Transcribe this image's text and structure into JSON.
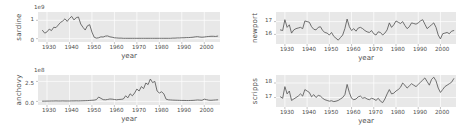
{
  "figure": {
    "width": 463,
    "height": 135,
    "background": "#ffffff",
    "panel_background": "#e8e8e8",
    "line_color": "#595959",
    "grid_color": "#ffffff"
  },
  "chart_data": [
    {
      "type": "line",
      "name": "sardine",
      "ylabel": "sardine",
      "xlabel": "year",
      "exponent": "1e9",
      "yticks": [
        "0",
        "1"
      ],
      "ytick_values": [
        0,
        1
      ],
      "ylim": [
        -0.18,
        1.45
      ],
      "xlim": [
        1926,
        2007
      ],
      "xticks": [
        "1930",
        "1940",
        "1950",
        "1960",
        "1970",
        "1980",
        "1990",
        "2000"
      ],
      "xtick_values": [
        1930,
        1940,
        1950,
        1960,
        1970,
        1980,
        1990,
        2000
      ],
      "grid": true,
      "x": [
        1928,
        1929,
        1930,
        1931,
        1932,
        1933,
        1934,
        1935,
        1936,
        1937,
        1938,
        1939,
        1940,
        1941,
        1942,
        1943,
        1944,
        1945,
        1946,
        1947,
        1948,
        1949,
        1950,
        1951,
        1952,
        1953,
        1954,
        1955,
        1956,
        1957,
        1958,
        1959,
        1960,
        1961,
        1962,
        1963,
        1964,
        1965,
        1966,
        1967,
        1968,
        1969,
        1970,
        1971,
        1972,
        1973,
        1974,
        1975,
        1976,
        1977,
        1978,
        1979,
        1980,
        1981,
        1982,
        1983,
        1984,
        1985,
        1986,
        1987,
        1988,
        1989,
        1990,
        1991,
        1992,
        1993,
        1994,
        1995,
        1996,
        1997,
        1998,
        1999,
        2000,
        2001,
        2002,
        2003,
        2004,
        2005,
        2006
      ],
      "y": [
        0.45,
        0.3,
        0.37,
        0.52,
        0.44,
        0.62,
        0.6,
        0.74,
        0.88,
        0.96,
        1.08,
        0.94,
        1.1,
        1.21,
        1.02,
        1.14,
        1.18,
        0.8,
        0.62,
        0.47,
        0.7,
        0.76,
        0.36,
        0.08,
        0.03,
        0.05,
        0.1,
        0.09,
        0.14,
        0.15,
        0.1,
        0.08,
        0.05,
        0.04,
        0.03,
        0.03,
        0.02,
        0.02,
        0.02,
        0.02,
        0.02,
        0.02,
        0.02,
        0.02,
        0.02,
        0.02,
        0.02,
        0.02,
        0.02,
        0.02,
        0.02,
        0.02,
        0.02,
        0.02,
        0.02,
        0.02,
        0.02,
        0.02,
        0.03,
        0.03,
        0.04,
        0.04,
        0.05,
        0.05,
        0.06,
        0.06,
        0.07,
        0.08,
        0.1,
        0.11,
        0.09,
        0.08,
        0.09,
        0.11,
        0.12,
        0.13,
        0.13,
        0.12,
        0.14
      ]
    },
    {
      "type": "line",
      "name": "anchovy",
      "ylabel": "anchovy",
      "xlabel": "year",
      "exponent": "1e8",
      "yticks": [
        "0.0",
        "2.5"
      ],
      "ytick_values": [
        0.0,
        2.5
      ],
      "ylim": [
        -0.45,
        3.3
      ],
      "xlim": [
        1926,
        2007
      ],
      "xticks": [
        "1930",
        "1940",
        "1950",
        "1960",
        "1970",
        "1980",
        "1990",
        "2000"
      ],
      "xtick_values": [
        1930,
        1940,
        1950,
        1960,
        1970,
        1980,
        1990,
        2000
      ],
      "grid": true,
      "x": [
        1928,
        1929,
        1930,
        1931,
        1932,
        1933,
        1934,
        1935,
        1936,
        1937,
        1938,
        1939,
        1940,
        1941,
        1942,
        1943,
        1944,
        1945,
        1946,
        1947,
        1948,
        1949,
        1950,
        1951,
        1952,
        1953,
        1954,
        1955,
        1956,
        1957,
        1958,
        1959,
        1960,
        1961,
        1962,
        1963,
        1964,
        1965,
        1966,
        1967,
        1968,
        1969,
        1970,
        1971,
        1972,
        1973,
        1974,
        1975,
        1976,
        1977,
        1978,
        1979,
        1980,
        1981,
        1982,
        1983,
        1984,
        1985,
        1986,
        1987,
        1988,
        1989,
        1990,
        1991,
        1992,
        1993,
        1994,
        1995,
        1996,
        1997,
        1998,
        1999,
        2000,
        2001,
        2002,
        2003,
        2004,
        2005,
        2006
      ],
      "y": [
        0.03,
        0.03,
        0.04,
        0.04,
        0.05,
        0.05,
        0.06,
        0.05,
        0.05,
        0.06,
        0.05,
        0.05,
        0.05,
        0.06,
        0.06,
        0.07,
        0.06,
        0.07,
        0.08,
        0.09,
        0.1,
        0.12,
        0.14,
        0.16,
        0.22,
        0.55,
        0.38,
        0.22,
        0.2,
        0.24,
        0.3,
        0.28,
        0.24,
        0.2,
        0.24,
        0.26,
        0.3,
        0.7,
        0.45,
        0.95,
        0.7,
        1.05,
        1.55,
        1.3,
        1.85,
        1.6,
        2.3,
        2.1,
        2.8,
        2.35,
        2.5,
        1.3,
        1.05,
        1.2,
        0.95,
        0.28,
        0.2,
        0.18,
        0.16,
        0.15,
        0.14,
        0.13,
        0.12,
        0.12,
        0.11,
        0.11,
        0.12,
        0.13,
        0.15,
        0.18,
        0.16,
        0.14,
        0.28,
        0.22,
        0.15,
        0.14,
        0.16,
        0.18,
        0.2
      ]
    },
    {
      "type": "line",
      "name": "newport",
      "ylabel": "newport",
      "xlabel": "year",
      "exponent": "",
      "yticks": [
        "16",
        "17"
      ],
      "ytick_values": [
        16,
        17
      ],
      "ylim": [
        15.25,
        17.75
      ],
      "xlim": [
        1926,
        2007
      ],
      "xticks": [
        "1930",
        "1940",
        "1950",
        "1960",
        "1970",
        "1980",
        "1990",
        "2000"
      ],
      "xtick_values": [
        1930,
        1940,
        1950,
        1960,
        1970,
        1980,
        1990,
        2000
      ],
      "grid": true,
      "x": [
        1928,
        1929,
        1930,
        1931,
        1932,
        1933,
        1934,
        1935,
        1936,
        1937,
        1938,
        1939,
        1940,
        1941,
        1942,
        1943,
        1944,
        1945,
        1946,
        1947,
        1948,
        1949,
        1950,
        1951,
        1952,
        1953,
        1954,
        1955,
        1956,
        1957,
        1958,
        1959,
        1960,
        1961,
        1962,
        1963,
        1964,
        1965,
        1966,
        1967,
        1968,
        1969,
        1970,
        1971,
        1972,
        1973,
        1974,
        1975,
        1976,
        1977,
        1978,
        1979,
        1980,
        1981,
        1982,
        1983,
        1984,
        1985,
        1986,
        1987,
        1988,
        1989,
        1990,
        1991,
        1992,
        1993,
        1994,
        1995,
        1996,
        1997,
        1998,
        1999,
        2000,
        2001,
        2002,
        2003,
        2004,
        2005,
        2006
      ],
      "y": [
        16.35,
        16.3,
        17.15,
        16.55,
        16.75,
        16.1,
        16.35,
        16.45,
        16.5,
        16.55,
        16.45,
        17.05,
        17.0,
        16.95,
        16.6,
        16.4,
        16.35,
        16.55,
        16.6,
        16.3,
        16.15,
        16.1,
        15.95,
        16.15,
        15.85,
        15.7,
        15.55,
        15.75,
        15.95,
        16.45,
        17.2,
        16.6,
        16.3,
        16.45,
        16.25,
        16.5,
        16.55,
        16.45,
        16.3,
        16.2,
        16.15,
        16.3,
        16.05,
        15.95,
        16.2,
        16.15,
        15.95,
        16.1,
        16.35,
        16.9,
        16.55,
        16.75,
        17.05,
        16.95,
        16.85,
        17.0,
        16.7,
        16.45,
        16.6,
        16.9,
        16.85,
        16.8,
        16.9,
        17.05,
        17.15,
        16.8,
        16.45,
        16.6,
        16.75,
        16.9,
        16.55,
        15.95,
        15.65,
        16.05,
        16.1,
        16.15,
        16.05,
        16.25,
        16.3
      ]
    },
    {
      "type": "line",
      "name": "scripps",
      "ylabel": "scripps",
      "xlabel": "year",
      "exponent": "",
      "yticks": [
        "17",
        "18"
      ],
      "ytick_values": [
        17,
        18
      ],
      "ylim": [
        16.35,
        18.55
      ],
      "xlim": [
        1926,
        2007
      ],
      "xticks": [
        "1930",
        "1940",
        "1950",
        "1960",
        "1970",
        "1980",
        "1990",
        "2000"
      ],
      "xtick_values": [
        1930,
        1940,
        1950,
        1960,
        1970,
        1980,
        1990,
        2000
      ],
      "grid": true,
      "x": [
        1928,
        1929,
        1930,
        1931,
        1932,
        1933,
        1934,
        1935,
        1936,
        1937,
        1938,
        1939,
        1940,
        1941,
        1942,
        1943,
        1944,
        1945,
        1946,
        1947,
        1948,
        1949,
        1950,
        1951,
        1952,
        1953,
        1954,
        1955,
        1956,
        1957,
        1958,
        1959,
        1960,
        1961,
        1962,
        1963,
        1964,
        1965,
        1966,
        1967,
        1968,
        1969,
        1970,
        1971,
        1972,
        1973,
        1974,
        1975,
        1976,
        1977,
        1978,
        1979,
        1980,
        1981,
        1982,
        1983,
        1984,
        1985,
        1986,
        1987,
        1988,
        1989,
        1990,
        1991,
        1992,
        1993,
        1994,
        1995,
        1996,
        1997,
        1998,
        1999,
        2000,
        2001,
        2002,
        2003,
        2004,
        2005,
        2006
      ],
      "y": [
        17.05,
        16.95,
        17.75,
        17.25,
        17.45,
        16.8,
        16.9,
        17.0,
        17.1,
        17.25,
        17.1,
        17.55,
        17.45,
        17.35,
        17.05,
        17.2,
        17.0,
        17.15,
        17.1,
        16.95,
        16.85,
        16.8,
        16.75,
        16.78,
        16.72,
        16.75,
        16.8,
        16.9,
        17.0,
        17.2,
        17.9,
        17.35,
        16.95,
        16.85,
        16.9,
        17.05,
        17.1,
        16.95,
        17.0,
        16.9,
        16.85,
        16.95,
        16.9,
        16.8,
        16.95,
        16.75,
        16.65,
        16.9,
        17.25,
        17.55,
        17.25,
        17.3,
        17.45,
        17.55,
        17.7,
        18.0,
        17.85,
        17.65,
        17.8,
        17.95,
        17.85,
        17.75,
        17.9,
        18.05,
        18.2,
        18.35,
        18.1,
        17.85,
        18.25,
        18.4,
        18.15,
        17.65,
        17.35,
        17.55,
        17.75,
        17.85,
        17.95,
        18.05,
        18.3
      ]
    }
  ]
}
